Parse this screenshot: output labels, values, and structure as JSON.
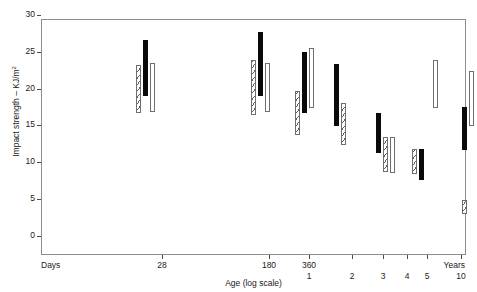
{
  "chart_data": {
    "type": "bar",
    "title": "",
    "subtitle": "",
    "xlabel": "Age (log scale)",
    "ylabel": "Impact strength – KJ/m",
    "ylabel_sup": "2",
    "ylim": [
      0,
      32
    ],
    "yticks": [
      0,
      5,
      10,
      15,
      20,
      25,
      30
    ],
    "ytick_labels": [
      "0",
      "5",
      "10",
      "15",
      "20",
      "25",
      "30"
    ],
    "grid": false,
    "legend": "none",
    "legend_entries": [
      {
        "name": "Series A",
        "fill": "hatch"
      },
      {
        "name": "Series B",
        "fill": "solid"
      },
      {
        "name": "Series C",
        "fill": "open"
      }
    ],
    "x_axis": {
      "scale": "log",
      "unit_row1": "Days",
      "unit_row2": "Years",
      "ticks": [
        {
          "label": "Days",
          "row": 1,
          "anchor": "left",
          "pos_px": 0,
          "tick": false
        },
        {
          "label": "28",
          "row": 1,
          "anchor": "center",
          "pos_px": 121,
          "tick": true
        },
        {
          "label": "180",
          "row": 1,
          "anchor": "center",
          "pos_px": 228,
          "tick": true
        },
        {
          "label": "360",
          "row": 1,
          "anchor": "center",
          "pos_px": 268,
          "tick": true
        },
        {
          "label": "1",
          "row": 2,
          "anchor": "center",
          "pos_px": 268,
          "tick": false
        },
        {
          "label": "2",
          "row": 2,
          "anchor": "center",
          "pos_px": 311,
          "tick": true
        },
        {
          "label": "3",
          "row": 2,
          "anchor": "center",
          "pos_px": 342,
          "tick": true
        },
        {
          "label": "4",
          "row": 2,
          "anchor": "center",
          "pos_px": 366,
          "tick": true
        },
        {
          "label": "5",
          "row": 2,
          "anchor": "center",
          "pos_px": 386,
          "tick": true
        },
        {
          "label": "Years",
          "row": 1,
          "anchor": "right",
          "pos_px": 424,
          "tick": false
        },
        {
          "label": "10",
          "row": 2,
          "anchor": "center",
          "pos_px": 420,
          "tick": true
        }
      ]
    },
    "note": "Floating range bars: each bar spans a low-to-high impact strength interval.",
    "bars": [
      {
        "group": "28",
        "series": "Series A",
        "fill": "hatch",
        "low": 19.2,
        "high": 25.7,
        "x_px": 97
      },
      {
        "group": "28",
        "series": "Series B",
        "fill": "solid",
        "low": 21.5,
        "high": 29.2,
        "x_px": 104
      },
      {
        "group": "28",
        "series": "Series C",
        "fill": "open",
        "low": 19.4,
        "high": 26.1,
        "x_px": 111
      },
      {
        "group": "180",
        "series": "Series A",
        "fill": "hatch",
        "low": 19.0,
        "high": 26.5,
        "x_px": 212
      },
      {
        "group": "180",
        "series": "Series B",
        "fill": "solid",
        "low": 21.6,
        "high": 30.2,
        "x_px": 219
      },
      {
        "group": "180",
        "series": "Series C",
        "fill": "open",
        "low": 19.4,
        "high": 26.1,
        "x_px": 226
      },
      {
        "group": "360",
        "series": "Series A",
        "fill": "hatch",
        "low": 16.3,
        "high": 22.3,
        "x_px": 256
      },
      {
        "group": "360",
        "series": "Series B",
        "fill": "solid",
        "low": 19.2,
        "high": 27.5,
        "x_px": 263
      },
      {
        "group": "360",
        "series": "Series C",
        "fill": "open",
        "low": 19.9,
        "high": 28.1,
        "x_px": 270
      },
      {
        "group": "2",
        "series": "Series B",
        "fill": "solid",
        "low": 17.5,
        "high": 25.9,
        "x_px": 295
      },
      {
        "group": "2",
        "series": "Series A",
        "fill": "hatch",
        "low": 14.9,
        "high": 20.6,
        "x_px": 302
      },
      {
        "group": "3",
        "series": "Series B",
        "fill": "solid",
        "low": 13.8,
        "high": 19.3,
        "x_px": 337
      },
      {
        "group": "3",
        "series": "Series A",
        "fill": "hatch",
        "low": 11.3,
        "high": 16.0,
        "x_px": 344
      },
      {
        "group": "3",
        "series": "Series C",
        "fill": "open",
        "low": 11.1,
        "high": 16.0,
        "x_px": 351
      },
      {
        "group": "5",
        "series": "Series A",
        "fill": "hatch",
        "low": 11.0,
        "high": 14.4,
        "x_px": 373
      },
      {
        "group": "5",
        "series": "Series B",
        "fill": "solid",
        "low": 10.2,
        "high": 14.4,
        "x_px": 380
      },
      {
        "group": "5",
        "series": "Series C",
        "fill": "open",
        "low": 19.9,
        "high": 26.4,
        "x_px": 394
      },
      {
        "group": "10",
        "series": "Series C",
        "fill": "open",
        "low": 17.5,
        "high": 25.0,
        "x_px": 430
      },
      {
        "group": "10",
        "series": "Series B",
        "fill": "solid",
        "low": 14.3,
        "high": 20.1,
        "x_px": 423
      },
      {
        "group": "10",
        "series": "Series A",
        "fill": "hatch",
        "low": 5.6,
        "high": 7.5,
        "x_px": 423
      }
    ]
  }
}
